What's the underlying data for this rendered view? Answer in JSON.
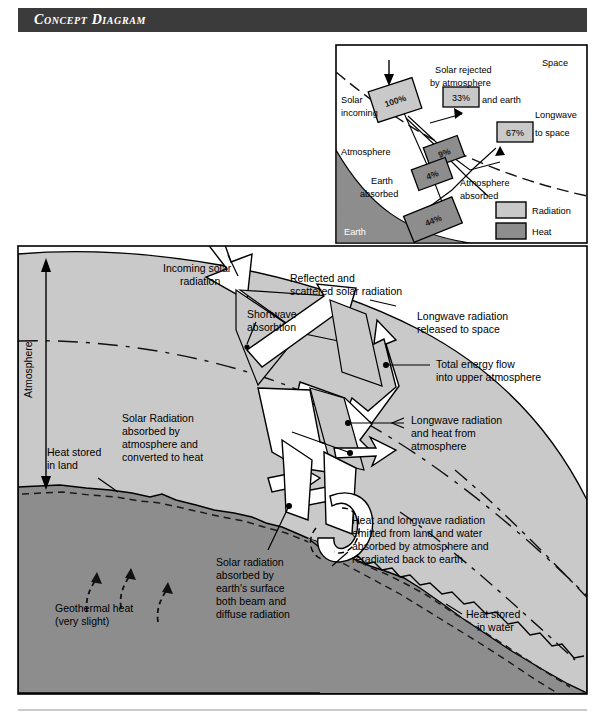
{
  "banner": {
    "title": "Concept Diagram"
  },
  "colors": {
    "banner_bg": "#3b3b3b",
    "atmosphere": "#c9c9c9",
    "ground": "#8d8d8d",
    "radiation_swatch": "#c9c9c9",
    "heat_swatch": "#8d8d8d",
    "white_arrow": "#ffffff",
    "stroke": "#000000"
  },
  "main": {
    "labels": {
      "incoming_solar": "Incoming solar\nradiation",
      "reflected_scattered": "Reflected and\nscattered solar radiation",
      "shortwave_absorption": "Shortwave\nabsorbtion",
      "longwave_released": "Longwave radiation\nreleased to space",
      "total_energy_flow": "Total energy flow\ninto upper atmosphere",
      "longwave_heat_atmos": "Longwave radiation\nand heat from\natmosphere",
      "solar_absorbed_atmos": "Solar Radiation\nabsorbed by\natmosphere and\nconverted to heat",
      "atmosphere_axis": "Atmosphere",
      "heat_stored_land": "Heat stored\nin land",
      "heat_stored_water": "Heat stored\nin water",
      "geothermal": "Geothermal heat\n(very slight)",
      "solar_absorbed_surface": "Solar radiation\nabsorbed by\nearth's surface\nboth beam and\ndiffuse radiation",
      "heat_longwave_emitted": "Heat and longwave radiation\nemitted from land and water\nabsorbed by atmosphere and\nreradiated back to earth"
    },
    "label_lines": {
      "incoming_solar": [
        "Incoming solar",
        "radiation"
      ],
      "reflected_scattered": [
        "Reflected and",
        "scattered solar radiation"
      ],
      "shortwave_absorption": [
        "Shortwave",
        "absorbtion"
      ],
      "longwave_released": [
        "Longwave radiation",
        "released to space"
      ],
      "total_energy_flow": [
        "Total energy flow",
        "into upper atmosphere"
      ],
      "longwave_heat_atmos": [
        "Longwave radiation",
        "and heat from",
        "atmosphere"
      ],
      "solar_absorbed_atmos": [
        "Solar Radiation",
        "absorbed by",
        "atmosphere and",
        "converted to heat"
      ],
      "heat_stored_land": [
        "Heat stored",
        "in land"
      ],
      "heat_stored_water": [
        "Heat stored",
        "in water"
      ],
      "geothermal": [
        "Geothermal heat",
        "(very slight)"
      ],
      "solar_absorbed_surface": [
        "Solar radiation",
        "absorbed by",
        "earth's surface",
        "both beam and",
        "diffuse radiation"
      ],
      "heat_longwave_emitted": [
        "Heat and longwave radiation",
        "emitted from land and water",
        "absorbed by atmosphere and",
        "reradiated back to earth"
      ]
    }
  },
  "inset": {
    "zones": {
      "space": "Space",
      "atmosphere": "Atmosphere",
      "earth": "Earth"
    },
    "labels": {
      "solar_incoming": [
        "Solar",
        "incoming"
      ],
      "solar_rejected": [
        "Solar rejected",
        "by atmosphere",
        "and earth"
      ],
      "longwave_to_space": [
        "Longwave",
        "to space"
      ],
      "earth_absorbed": [
        "Earth",
        "absorbed"
      ],
      "atmosphere_absorbed": [
        "Atmosphere",
        "absorbed"
      ]
    },
    "values": {
      "solar_incoming_pct": "100%",
      "solar_rejected_pct": "33%",
      "longwave_to_space_pct": "67%",
      "atmosphere_absorbed_upper_pct": "9%",
      "atmosphere_absorbed_lower_pct": "4%",
      "earth_absorbed_pct": "44%"
    },
    "legend": [
      {
        "label": "Radiation",
        "type": "radiation"
      },
      {
        "label": "Heat",
        "type": "heat"
      }
    ]
  }
}
